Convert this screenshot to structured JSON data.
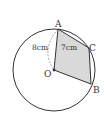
{
  "diagram": {
    "type": "geometry-circle",
    "points": {
      "A": {
        "label": "A",
        "x": 58,
        "y": 29
      },
      "B": {
        "label": "B",
        "x": 91,
        "y": 84
      },
      "C": {
        "label": "C",
        "x": 89,
        "y": 48
      },
      "O": {
        "label": "O",
        "x": 54,
        "y": 70
      }
    },
    "circle": {
      "cx": 54,
      "cy": 70,
      "r": 41
    },
    "measurements": {
      "OA": "8cm",
      "AC": "7cm"
    },
    "shaded_region": "quadrilateral OACB",
    "colors": {
      "stroke": "#333333",
      "shade": "#d9d9d9",
      "dashed": "#888888"
    }
  }
}
